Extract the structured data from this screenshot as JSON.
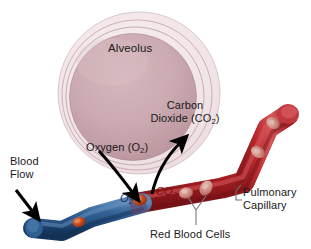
{
  "figure": {
    "background_color": "#ffffff",
    "width": 311,
    "height": 249
  },
  "labels": {
    "alveolus": "Alveolus",
    "carbon_dioxide": "Carbon\nDioxide (CO",
    "carbon_dioxide_line1": "Carbon",
    "carbon_dioxide_line2_pre": "Dioxide (CO",
    "carbon_dioxide_sub": "2",
    "carbon_dioxide_line2_post": ")",
    "oxygen_pre": "Oxygen (O",
    "oxygen_sub": "2",
    "oxygen_post": ")",
    "blood_flow_line1": "Blood",
    "blood_flow_line2": "Flow",
    "pulmonary_capillary_line1": "Pulmonary",
    "pulmonary_capillary_line2": "Capillary",
    "red_blood_cells": "Red Blood Cells",
    "o2_inline_pre": "O",
    "o2_inline_sub": "2",
    "co2_inline_pre": "CO",
    "co2_inline_sub": "2"
  },
  "colors": {
    "alveolus_fill": "#c9a5ad",
    "alveolus_fill_light": "#d9bcc2",
    "alveolus_ring": "#b99ba2",
    "alveolus_outer_halo": "#ead9dc",
    "vein_blue": "#2d5b8e",
    "vein_blue_dark": "#1d3f66",
    "vein_blue_light": "#4b7cb0",
    "artery_red": "#b5252a",
    "artery_red_dark": "#7d1418",
    "artery_red_light": "#d4474b",
    "rbc_in_blue": "#c0441f",
    "rbc_in_red": "#cf8b84",
    "arrow_black": "#000000",
    "leader_gray": "#8a8a8a",
    "text": "#1a1a1a",
    "o2_text": "#15305e",
    "co2_text": "#7d0f14"
  },
  "elements": {
    "alveolus_rings": 3,
    "red_blood_cell_count_in_capillary": 4,
    "red_blood_cell_count_in_vein": 2,
    "arrows": [
      {
        "name": "oxygen-diffusion-arrow",
        "direction": "alveolus-to-blood"
      },
      {
        "name": "carbon-dioxide-diffusion-arrow",
        "direction": "blood-to-alveolus"
      },
      {
        "name": "blood-flow-arrow",
        "direction": "into-vein"
      }
    ]
  }
}
